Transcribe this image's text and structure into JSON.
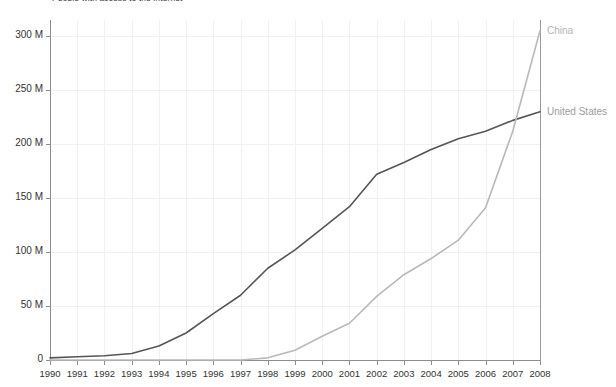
{
  "chart_data": {
    "type": "line",
    "title": "People with access to the internet",
    "xlabel": "",
    "ylabel": "",
    "x": [
      1990,
      1991,
      1992,
      1993,
      1994,
      1995,
      1996,
      1997,
      1998,
      1999,
      2000,
      2001,
      2002,
      2003,
      2004,
      2005,
      2006,
      2007,
      2008
    ],
    "xlim": [
      1990,
      2008
    ],
    "ylim": [
      0,
      315
    ],
    "y_unit": "M",
    "yticks": [
      0,
      50,
      100,
      150,
      200,
      250,
      300
    ],
    "ytick_labels": [
      "0",
      "50 M",
      "100 M",
      "150 M",
      "200 M",
      "250 M",
      "300 M"
    ],
    "xtick_labels": [
      "1990",
      "1991",
      "1992",
      "1993",
      "1994",
      "1995",
      "1996",
      "1997",
      "1998",
      "1999",
      "2000",
      "2001",
      "2002",
      "2003",
      "2004",
      "2005",
      "2006",
      "2007",
      "2008"
    ],
    "grid": true,
    "legend_position": "right-of-plot-line-end",
    "series": [
      {
        "name": "United States",
        "color": "#565656",
        "values": [
          2,
          3,
          4,
          6,
          13,
          25,
          43,
          60,
          85,
          102,
          122,
          142,
          172,
          183,
          195,
          205,
          212,
          222,
          230
        ]
      },
      {
        "name": "China",
        "color": "#b9b9b9",
        "values": [
          0,
          0,
          0,
          0,
          0,
          0,
          0,
          0,
          2,
          9,
          22,
          34,
          59,
          79,
          94,
          111,
          141,
          212,
          305
        ]
      }
    ],
    "annotations": [
      {
        "text": "China",
        "series": "China",
        "x": 2008,
        "y": 305
      },
      {
        "text": "United States",
        "series": "United States",
        "x": 2008,
        "y": 230
      }
    ]
  },
  "axes": {
    "y_labels": [
      "300 M",
      "250 M",
      "200 M",
      "150 M",
      "100 M",
      "50 M",
      "0"
    ],
    "x_labels": [
      "1990",
      "1991",
      "1992",
      "1993",
      "1994",
      "1995",
      "1996",
      "1997",
      "1998",
      "1999",
      "2000",
      "2001",
      "2002",
      "2003",
      "2004",
      "2005",
      "2006",
      "2007",
      "2008"
    ]
  },
  "legend": {
    "china": "China",
    "united_states": "United States"
  },
  "colors": {
    "china_line": "#b9b9b9",
    "us_line": "#565656",
    "axis": "#8d8d8d",
    "grid": "#f1f1f1",
    "text": "#333333"
  }
}
